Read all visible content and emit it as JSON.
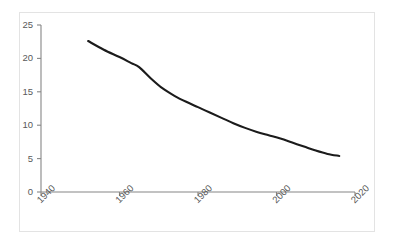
{
  "chart_data": {
    "type": "line",
    "title": "",
    "subtitle": "",
    "xlabel": "",
    "ylabel": "",
    "xlim": [
      1940,
      2020
    ],
    "ylim": [
      0,
      25
    ],
    "grid": false,
    "legend": null,
    "legend_position": "none",
    "xticks": [
      "1940",
      "1960",
      "1980",
      "2000",
      "2020"
    ],
    "xtick_values": [
      1940,
      1960,
      1980,
      2000,
      2020
    ],
    "xtick_rotation": -45,
    "yticks": [
      "0",
      "5",
      "10",
      "15",
      "20",
      "25"
    ],
    "ytick_values": [
      0,
      5,
      10,
      15,
      20,
      25
    ],
    "series": [
      {
        "name": "series-1",
        "color": "#1b1b1b",
        "x": [
          1952,
          1956,
          1960,
          1963,
          1965,
          1968,
          1971,
          1974,
          1977,
          1980,
          1983,
          1986,
          1989,
          1992,
          1995,
          1998,
          2001,
          2004,
          2007,
          2010,
          2013,
          2016
        ],
        "values": [
          22.6,
          21.3,
          20.2,
          19.3,
          18.7,
          17.0,
          15.5,
          14.4,
          13.5,
          12.7,
          11.9,
          11.1,
          10.3,
          9.6,
          9.0,
          8.5,
          8.0,
          7.4,
          6.8,
          6.2,
          5.7,
          5.4
        ]
      }
    ],
    "colors": {
      "line": "#1b1b1b",
      "axis": "#868686",
      "tick_text": "#595959",
      "frame_border": "#e3e3e3",
      "background": "#ffffff"
    }
  }
}
